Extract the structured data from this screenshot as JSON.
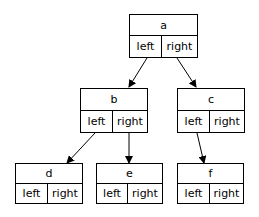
{
  "diagram": {
    "type": "binary-tree-record-nodes",
    "nodes": [
      {
        "id": "a",
        "label": "a",
        "fields": [
          "left",
          "right"
        ]
      },
      {
        "id": "b",
        "label": "b",
        "fields": [
          "left",
          "right"
        ]
      },
      {
        "id": "c",
        "label": "c",
        "fields": [
          "left",
          "right"
        ]
      },
      {
        "id": "d",
        "label": "d",
        "fields": [
          "left",
          "right"
        ]
      },
      {
        "id": "e",
        "label": "e",
        "fields": [
          "left",
          "right"
        ]
      },
      {
        "id": "f",
        "label": "f",
        "fields": [
          "left",
          "right"
        ]
      }
    ],
    "edges": [
      {
        "from": "a.left",
        "to": "b"
      },
      {
        "from": "a.right",
        "to": "c"
      },
      {
        "from": "b.left",
        "to": "d"
      },
      {
        "from": "b.right",
        "to": "e"
      },
      {
        "from": "c.left",
        "to": "f"
      }
    ],
    "colors": {
      "stroke": "#000000",
      "background": "#ffffff",
      "text": "#000000"
    }
  }
}
